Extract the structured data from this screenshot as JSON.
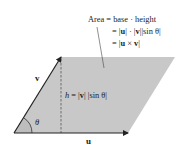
{
  "diagram": {
    "type": "parallelogram-area-cross-product",
    "colors": {
      "fill": "#c8c8c8",
      "vectors": "#222222",
      "height_line": "#555555",
      "angle_fill": "#bdbdbd"
    },
    "vertices": {
      "origin": [
        14,
        133
      ],
      "v_tip": [
        61,
        57
      ],
      "far_corner": [
        175,
        57
      ],
      "u_tip": [
        128,
        133
      ]
    },
    "labels": {
      "u": "u",
      "v": "v",
      "theta": "θ",
      "height": {
        "h": "h",
        "eq": " = |",
        "v": "v",
        "rest": "| |sin θ|"
      },
      "area": {
        "line1": "Area = base · height",
        "line2_pre": "= |",
        "line2_u": "u",
        "line2_mid": "| · |",
        "line2_v": "v",
        "line2_post": "||sin θ|",
        "line3_pre": "= |",
        "line3_u": "u",
        "line3_mid": " × ",
        "line3_v": "v",
        "line3_post": "|"
      }
    }
  }
}
